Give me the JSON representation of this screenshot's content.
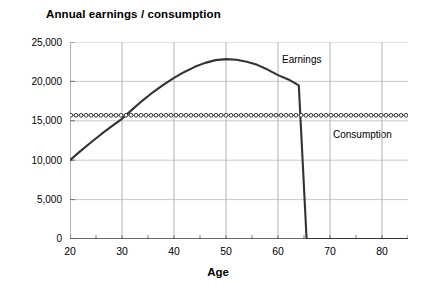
{
  "chart_data": {
    "type": "line",
    "title": "Annual earnings / consumption",
    "xlabel": "Age",
    "ylabel": "",
    "xlim": [
      20,
      85
    ],
    "ylim": [
      0,
      25000
    ],
    "grid": true,
    "legend_position": "inline-annotations",
    "x_ticks": [
      20,
      30,
      40,
      50,
      60,
      70,
      80
    ],
    "x_tick_labels": [
      "20",
      "30",
      "40",
      "50",
      "60",
      "70",
      "80"
    ],
    "x_minor_ticks": [
      25,
      35,
      45,
      55,
      65,
      75,
      85
    ],
    "y_ticks": [
      0,
      5000,
      10000,
      15000,
      20000,
      25000
    ],
    "y_tick_labels": [
      "0",
      "5,000",
      "10,000",
      "15,000",
      "20,000",
      "25,000"
    ],
    "annotations": [
      {
        "text": "Earnings",
        "x": 59,
        "y": 23300
      },
      {
        "text": "Consumption",
        "x": 70,
        "y": 13300
      }
    ],
    "series": [
      {
        "name": "Earnings",
        "style": "solid-line",
        "color": "#333333",
        "x": [
          20,
          22,
          24,
          26,
          28,
          30,
          32,
          34,
          36,
          38,
          40,
          42,
          44,
          46,
          48,
          50,
          52,
          54,
          56,
          58,
          60,
          62,
          64,
          65.5,
          68,
          72,
          76,
          80,
          85
        ],
        "values": [
          10000,
          11150,
          12250,
          13300,
          14300,
          15250,
          16450,
          17600,
          18650,
          19600,
          20450,
          21200,
          21850,
          22350,
          22700,
          22830,
          22750,
          22500,
          22100,
          21500,
          20800,
          20250,
          19500,
          0,
          0,
          0,
          0,
          0,
          0
        ]
      },
      {
        "name": "Consumption",
        "style": "open-circle-markers",
        "color": "#222222",
        "x": [
          20,
          85
        ],
        "values": [
          15700,
          15700
        ]
      }
    ],
    "crossing_point": {
      "x": 29,
      "y": 15700
    },
    "peak": {
      "x": 50,
      "y": 22830
    },
    "retirement_age": 65
  }
}
